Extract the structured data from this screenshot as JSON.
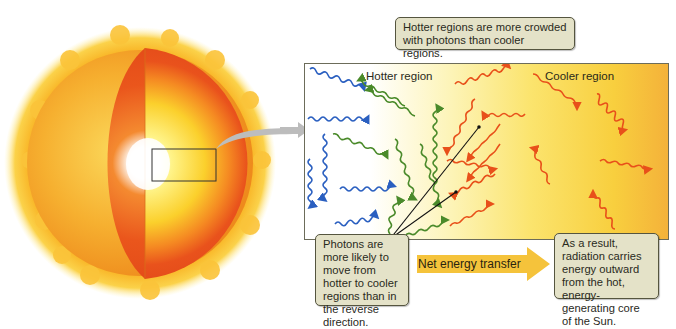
{
  "figure": {
    "sun_diagram": {
      "description": "Cutaway view of the Sun with zoom box near the core",
      "zoom_box": {
        "x": 152,
        "y": 149,
        "w": 64,
        "h": 32
      }
    },
    "panel": {
      "hotter_label": "Hotter region",
      "cooler_label": "Cooler region"
    },
    "callouts": {
      "top": "Hotter regions are more crowded with photons than cooler regions.",
      "bottom_left": "Photons are more likely to move from hotter to cooler regions than in the reverse direction.",
      "bottom_right": "As a result, radiation carries energy outward from the hot, energy-generating core of the Sun."
    },
    "net_arrow": {
      "label": "Net energy transfer",
      "color": "#f5c33b"
    },
    "colors": {
      "photon_blue": "#2a5fc0",
      "photon_green": "#4a8a2a",
      "photon_orange": "#e8501a",
      "callout_bg": "#e4e2c8",
      "sun_outer": "#f6a623",
      "sun_inner_red": "#ea4b1b",
      "core_white": "#ffffff"
    }
  }
}
